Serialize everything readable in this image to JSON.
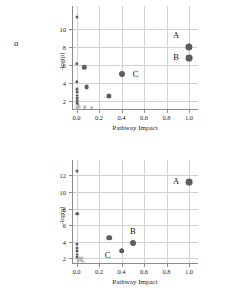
{
  "figure": {
    "panel_a_letter": "a",
    "panel_b_letter": "b"
  },
  "chart_data": [
    {
      "type": "scatter",
      "panel": "a",
      "title": "",
      "xlabel": "Pathway Impact",
      "ylabel": "-log(p)",
      "xlim": [
        -0.04,
        1.08
      ],
      "ylim": [
        1.0,
        11.6
      ],
      "xticks": [
        0.0,
        0.2,
        0.4,
        0.6,
        0.8,
        1.0
      ],
      "xticklabels": [
        "0.0",
        "0.2",
        "0.4",
        "0.6",
        "0.8",
        "1.0"
      ],
      "yticks": [
        2,
        4,
        6,
        8,
        10
      ],
      "yticklabels": [
        "2",
        "4",
        "6",
        "8",
        "10"
      ],
      "grid": true,
      "legend": "none",
      "marker_color": "#5e5e5e",
      "small_marker_color": "#b9b9b9",
      "points": [
        {
          "x": 1.0,
          "y": 7.95,
          "r": 3.6,
          "label": "A",
          "label_dx": -13,
          "label_dy": -12
        },
        {
          "x": 1.0,
          "y": 6.75,
          "r": 3.4,
          "label": "B",
          "label_dx": -13,
          "label_dy": -1
        },
        {
          "x": 0.4,
          "y": 5.0,
          "r": 3.0,
          "label": "C",
          "label_dx": 14,
          "label_dy": 0
        },
        {
          "x": 0.07,
          "y": 5.7,
          "r": 2.2,
          "label": "",
          "label_dx": 0,
          "label_dy": 0
        },
        {
          "x": 0.09,
          "y": 3.5,
          "r": 2.4,
          "label": "",
          "label_dx": 0,
          "label_dy": 0
        },
        {
          "x": 0.29,
          "y": 2.55,
          "r": 2.6,
          "label": "",
          "label_dx": 0,
          "label_dy": 0
        },
        {
          "x": 0.005,
          "y": 11.3,
          "r": 1.5,
          "label": "",
          "label_dx": 0,
          "label_dy": 0
        },
        {
          "x": 0.005,
          "y": 6.1,
          "r": 1.7,
          "label": "",
          "label_dx": 0,
          "label_dy": 0
        },
        {
          "x": 0.005,
          "y": 4.1,
          "r": 1.7,
          "label": "",
          "label_dx": 0,
          "label_dy": 0
        },
        {
          "x": 0.005,
          "y": 3.35,
          "r": 1.5,
          "label": "",
          "label_dx": 0,
          "label_dy": 0
        },
        {
          "x": 0.005,
          "y": 3.0,
          "r": 1.4,
          "label": "",
          "label_dx": 0,
          "label_dy": 0
        },
        {
          "x": 0.005,
          "y": 2.6,
          "r": 1.4,
          "label": "",
          "label_dx": 0,
          "label_dy": 0
        },
        {
          "x": 0.005,
          "y": 2.3,
          "r": 1.3,
          "label": "",
          "label_dx": 0,
          "label_dy": 0
        },
        {
          "x": 0.005,
          "y": 2.05,
          "r": 1.3,
          "label": "",
          "label_dx": 0,
          "label_dy": 0
        },
        {
          "x": 0.005,
          "y": 1.75,
          "r": 1.3,
          "label": "",
          "label_dx": 0,
          "label_dy": 0
        }
      ],
      "small_points": [
        {
          "x": 0.012,
          "y": 1.55,
          "r": 1.5
        },
        {
          "x": 0.02,
          "y": 1.42,
          "r": 1.4
        },
        {
          "x": 0.03,
          "y": 1.5,
          "r": 1.3
        },
        {
          "x": 0.008,
          "y": 1.3,
          "r": 1.6
        },
        {
          "x": 0.022,
          "y": 1.25,
          "r": 1.4
        },
        {
          "x": 0.075,
          "y": 1.32,
          "r": 1.8
        },
        {
          "x": 0.135,
          "y": 1.28,
          "r": 1.9
        },
        {
          "x": 0.005,
          "y": 1.15,
          "r": 1.4
        }
      ]
    },
    {
      "type": "scatter",
      "panel": "b",
      "title": "",
      "xlabel": "Pathway Impact",
      "ylabel": "-log(p)",
      "xlim": [
        -0.04,
        1.08
      ],
      "ylim": [
        1.3,
        12.9
      ],
      "xticks": [
        0.0,
        0.2,
        0.4,
        0.6,
        0.8,
        1.0
      ],
      "xticklabels": [
        "0.0",
        "0.2",
        "0.4",
        "0.6",
        "0.8",
        "1.0"
      ],
      "yticks": [
        2,
        4,
        6,
        8,
        10,
        12
      ],
      "yticklabels": [
        "2",
        "4",
        "6",
        "8",
        "10",
        "12"
      ],
      "grid": true,
      "legend": "none",
      "marker_color": "#5e5e5e",
      "small_marker_color": "#b9b9b9",
      "points": [
        {
          "x": 1.0,
          "y": 11.2,
          "r": 3.4,
          "label": "A",
          "label_dx": -13,
          "label_dy": -1
        },
        {
          "x": 0.5,
          "y": 3.8,
          "r": 3.0,
          "label": "B",
          "label_dx": 0,
          "label_dy": -12
        },
        {
          "x": 0.4,
          "y": 2.9,
          "r": 2.8,
          "label": "C",
          "label_dx": -14,
          "label_dy": 4
        },
        {
          "x": 0.29,
          "y": 4.5,
          "r": 2.8,
          "label": "",
          "label_dx": 0,
          "label_dy": 0
        },
        {
          "x": 0.005,
          "y": 12.5,
          "r": 1.5,
          "label": "",
          "label_dx": 0,
          "label_dy": 0
        },
        {
          "x": 0.005,
          "y": 7.4,
          "r": 1.8,
          "label": "",
          "label_dx": 0,
          "label_dy": 0
        },
        {
          "x": 0.005,
          "y": 3.7,
          "r": 1.6,
          "label": "",
          "label_dx": 0,
          "label_dy": 0
        },
        {
          "x": 0.005,
          "y": 3.25,
          "r": 1.5,
          "label": "",
          "label_dx": 0,
          "label_dy": 0
        },
        {
          "x": 0.005,
          "y": 2.85,
          "r": 1.5,
          "label": "",
          "label_dx": 0,
          "label_dy": 0
        },
        {
          "x": 0.005,
          "y": 2.45,
          "r": 1.4,
          "label": "",
          "label_dx": 0,
          "label_dy": 0
        },
        {
          "x": 0.005,
          "y": 2.1,
          "r": 1.5,
          "label": "",
          "label_dx": 0,
          "label_dy": 0
        }
      ],
      "small_points": [
        {
          "x": 0.01,
          "y": 1.95,
          "r": 1.6
        },
        {
          "x": 0.03,
          "y": 2.0,
          "r": 1.5
        },
        {
          "x": 0.05,
          "y": 2.05,
          "r": 1.5
        },
        {
          "x": 0.018,
          "y": 1.8,
          "r": 1.4
        },
        {
          "x": 0.04,
          "y": 1.75,
          "r": 1.4
        },
        {
          "x": 0.012,
          "y": 1.62,
          "r": 1.5
        },
        {
          "x": 0.058,
          "y": 1.58,
          "r": 1.4
        }
      ]
    }
  ]
}
